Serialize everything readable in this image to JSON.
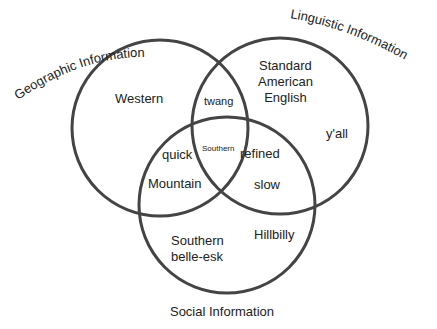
{
  "diagram": {
    "type": "venn",
    "sets": [
      {
        "id": "geo",
        "label": "Geographic Information",
        "color": "#444444"
      },
      {
        "id": "ling",
        "label": "Linguistic Information",
        "color": "#444444"
      },
      {
        "id": "soc",
        "label": "Social Information",
        "color": "#444444"
      }
    ],
    "regions": {
      "geo_only": [
        "Western"
      ],
      "ling_only": [
        "Standard American English",
        "y'all"
      ],
      "soc_only": [
        "Southern belle-esk",
        "Hillbilly"
      ],
      "geo_ling": [
        "twang"
      ],
      "geo_soc": [
        "quick",
        "Mountain"
      ],
      "ling_soc": [
        "refined",
        "slow"
      ],
      "all": [
        "Southern"
      ]
    },
    "text": {
      "western": "Western",
      "sae_line1": "Standard",
      "sae_line2": "American",
      "sae_line3": "English",
      "yall": "y'all",
      "twang": "twang",
      "southern_center": "Southern",
      "quick": "quick",
      "mountain": "Mountain",
      "refined": "refined",
      "slow": "slow",
      "belle_line1": "Southern",
      "belle_line2": "belle-esk",
      "hillbilly": "Hillbilly"
    }
  }
}
